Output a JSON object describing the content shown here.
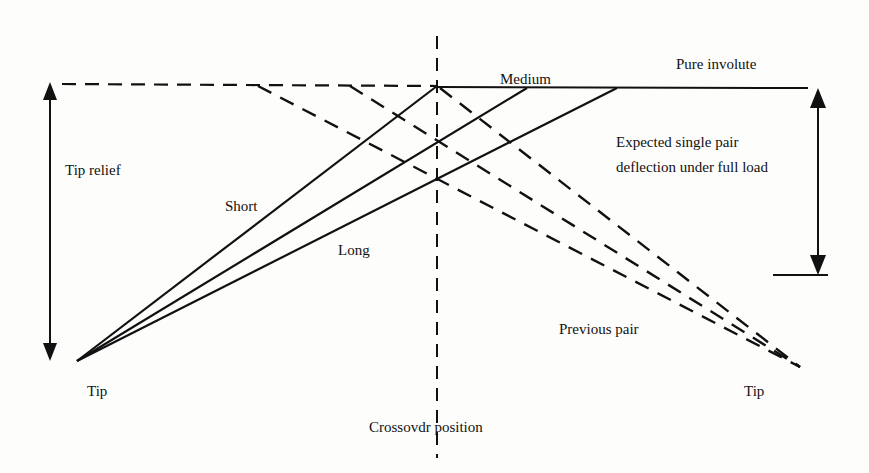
{
  "diagram": {
    "labels": {
      "tip_relief": "Tip relief",
      "short": "Short",
      "medium": "Medium",
      "long": "Long",
      "pure_involute": "Pure involute",
      "expected_line1": "Expected single pair",
      "expected_line2": "deflection under full load",
      "previous_pair": "Previous pair",
      "tip_left": "Tip",
      "tip_right": "Tip",
      "crossover": "Crossovdr position"
    },
    "colors": {
      "ink": "#111111",
      "background": "#fdfdfc"
    }
  }
}
